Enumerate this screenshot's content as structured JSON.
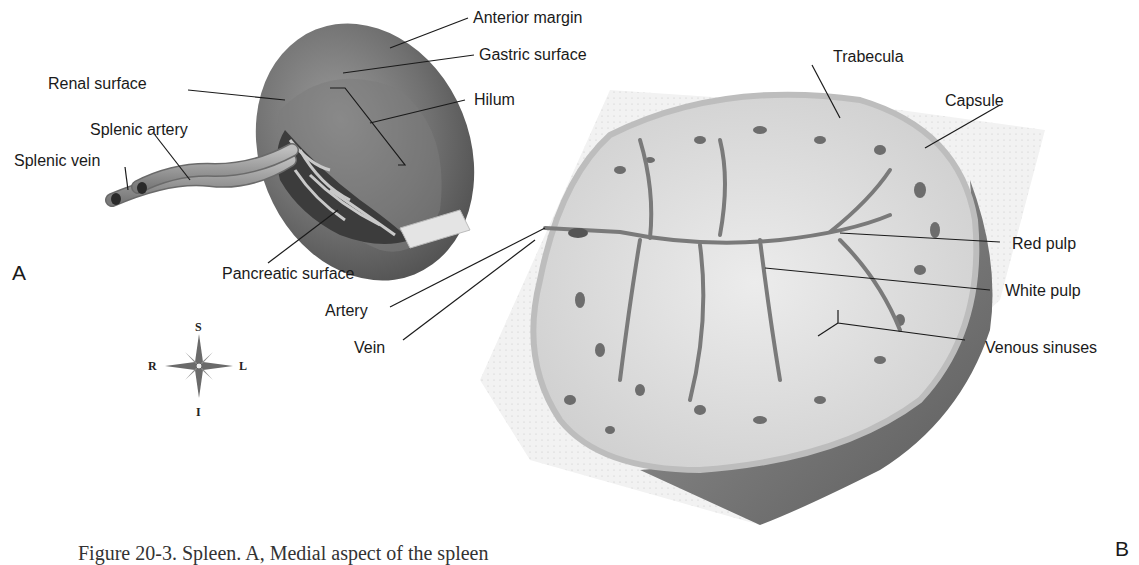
{
  "figure": {
    "panel_a_letter": "A",
    "panel_b_letter": "B",
    "caption": "Figure 20-3. Spleen. A, Medial aspect of the spleen"
  },
  "panel_a": {
    "labels": [
      {
        "text": "Anterior margin"
      },
      {
        "text": "Gastric surface"
      },
      {
        "text": "Renal surface"
      },
      {
        "text": "Hilum"
      },
      {
        "text": "Splenic artery"
      },
      {
        "text": "Splenic vein"
      },
      {
        "text": "Pancreatic surface"
      }
    ]
  },
  "panel_b": {
    "labels": [
      {
        "text": "Trabecula"
      },
      {
        "text": "Capsule"
      },
      {
        "text": "Red pulp"
      },
      {
        "text": "White pulp"
      },
      {
        "text": "Artery"
      },
      {
        "text": "Vein"
      },
      {
        "text": "Venous sinuses"
      }
    ]
  },
  "compass": {
    "top": "S",
    "bottom": "I",
    "left": "R",
    "right": "L"
  },
  "colors": {
    "organ_dark": "#6e6e6e",
    "organ_mid": "#8a8a8a",
    "tissue_light": "#d9d9d9",
    "leader_line": "#1a1a1a"
  }
}
